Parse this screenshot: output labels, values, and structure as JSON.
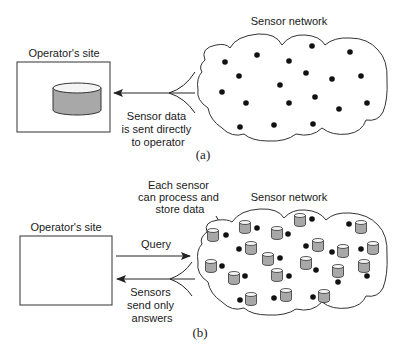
{
  "panel_a": {
    "operator_label": "Operator's site",
    "network_label": "Sensor network",
    "arrow_label": [
      "Sensor data",
      "is sent directly",
      "to operator"
    ],
    "caption": "(a)",
    "sensor_count": 19
  },
  "panel_b": {
    "operator_label": "Operator's site",
    "network_label": "Sensor network",
    "callout": [
      "Each sensor",
      "can process and",
      "store data"
    ],
    "query_label": "Query",
    "answer_label": [
      "Sensors",
      "send only",
      "answers"
    ],
    "caption": "(b)",
    "sensor_count": 19
  },
  "colors": {
    "stroke": "#222222",
    "dot": "#111111",
    "cylinder_fill": "#a8a8a8",
    "cylinder_top": "#f4f4f4"
  }
}
